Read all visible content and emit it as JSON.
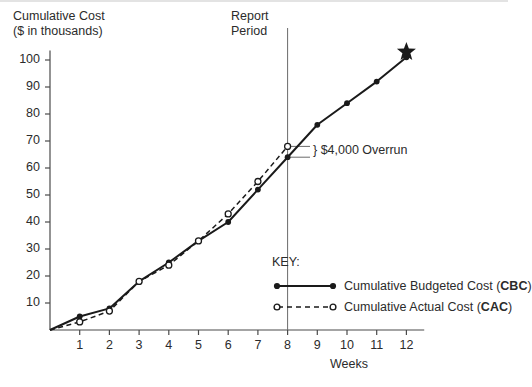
{
  "chart_data": {
    "type": "line",
    "title": "",
    "ylabel": "Cumulative Cost ($ in thousands)",
    "xlabel": "Weeks",
    "x": [
      0,
      1,
      2,
      3,
      4,
      5,
      6,
      7,
      8,
      9,
      10,
      11,
      12
    ],
    "xticks": [
      "1",
      "2",
      "3",
      "4",
      "5",
      "6",
      "7",
      "8",
      "9",
      "10",
      "11",
      "12"
    ],
    "yticks": [
      "10",
      "20",
      "30",
      "40",
      "50",
      "60",
      "70",
      "80",
      "90",
      "100"
    ],
    "xlim": [
      0,
      12.6
    ],
    "ylim": [
      0,
      107
    ],
    "grid": false,
    "legend_position": "inside-lower-right",
    "series": [
      {
        "name": "Cumulative Budgeted Cost (CBC)",
        "abbrev": "CBC",
        "style": "solid",
        "marker": "filled-circle",
        "color": "#1a1a1a",
        "x": [
          0,
          1,
          2,
          3,
          4,
          5,
          6,
          7,
          8,
          9,
          10,
          11,
          12
        ],
        "values": [
          0,
          5,
          8,
          18,
          25,
          33,
          40,
          52,
          64,
          76,
          84,
          92,
          101
        ]
      },
      {
        "name": "Cumulative Actual Cost (CAC)",
        "abbrev": "CAC",
        "style": "dashed",
        "marker": "open-circle",
        "color": "#1a1a1a",
        "x": [
          0,
          1,
          2,
          3,
          4,
          5,
          6,
          7,
          8
        ],
        "values": [
          0,
          3,
          7,
          18,
          24,
          33,
          43,
          55,
          68
        ]
      }
    ],
    "annotations": [
      {
        "name": "report-period-line",
        "type": "vline",
        "x": 8,
        "label": "Report Period"
      },
      {
        "name": "overrun-bracket",
        "type": "bracket",
        "x": 8,
        "y_from": 64,
        "y_to": 68,
        "label": "$4,000 Overrun"
      },
      {
        "name": "target-star",
        "type": "marker",
        "x": 12,
        "y": 103,
        "symbol": "star"
      }
    ]
  },
  "ylabel": {
    "line1": "Cumulative Cost",
    "line2": "($ in thousands)"
  },
  "report_period": {
    "line1": "Report",
    "line2": "Period"
  },
  "xlabel": "Weeks",
  "annotation": {
    "overrun": "} $4,000 Overrun"
  },
  "legend": {
    "title": "KEY:",
    "items": [
      {
        "label_prefix": "Cumulative Budgeted Cost (",
        "abbrev": "CBC",
        "label_suffix": ")"
      },
      {
        "label_prefix": "Cumulative Actual Cost (",
        "abbrev": "CAC",
        "label_suffix": ")"
      }
    ]
  },
  "colors": {
    "ink": "#1a1a1a",
    "axis": "#4a4a4a",
    "text": "#2b2b2b",
    "rule": "#e3e3e3"
  }
}
